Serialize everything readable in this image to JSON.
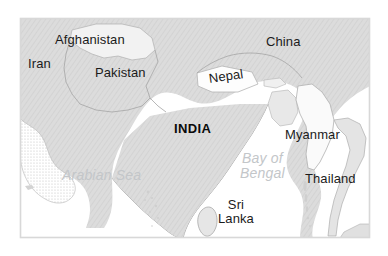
{
  "map": {
    "title": "South Asia regional map",
    "frame": {
      "x": 20,
      "y": 18,
      "width": 350,
      "height": 220,
      "border_color": "#d8d8d8"
    },
    "colors": {
      "land": "#d9d9d9",
      "land_hatch": "#cfcfcf",
      "land_highlight": "#f4f4f4",
      "water": "#ffffff",
      "border_line": "#a8a8a8",
      "coast_line": "#9a9a9a",
      "country_label": "#1b1b1b",
      "india_label": "#0a0a0a",
      "sea_label": "#c3c6c9"
    },
    "country_labels": [
      {
        "id": "iran",
        "text": "Iran",
        "x": 28,
        "y": 57,
        "style": "country"
      },
      {
        "id": "afghanistan",
        "text": "Afghanistan",
        "x": 55,
        "y": 33,
        "style": "country"
      },
      {
        "id": "pakistan",
        "text": "Pakistan",
        "x": 95,
        "y": 66,
        "style": "country"
      },
      {
        "id": "china",
        "text": "China",
        "x": 266,
        "y": 35,
        "style": "country"
      },
      {
        "id": "nepal",
        "text": "Nepal",
        "x": 208,
        "y": 72,
        "style": "country"
      },
      {
        "id": "india",
        "text": "INDIA",
        "x": 174,
        "y": 122,
        "style": "country-bold"
      },
      {
        "id": "myanmar",
        "text": "Myanmar",
        "x": 285,
        "y": 128,
        "style": "country"
      },
      {
        "id": "thailand",
        "text": "Thailand",
        "x": 305,
        "y": 172,
        "style": "country"
      },
      {
        "id": "sri-lanka",
        "text": "Sri\nLanka",
        "x": 218,
        "y": 198,
        "style": "country"
      }
    ],
    "sea_labels": [
      {
        "id": "arabian-sea",
        "text": "Arabian Sea",
        "x": 62,
        "y": 168
      },
      {
        "id": "bay-of-bengal",
        "text": "Bay of\nBengal",
        "x": 240,
        "y": 151
      }
    ]
  }
}
